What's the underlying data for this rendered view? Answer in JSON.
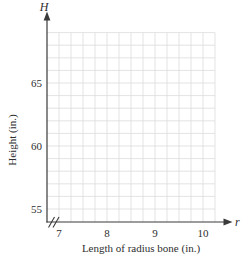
{
  "figure": {
    "background": "#ffffff",
    "axis_color": "#3a3a3a",
    "grid_color": "#dcdcdc",
    "text_color": "#2e2e2e"
  },
  "chart_data": {
    "type": "line",
    "title": "",
    "xlabel": "Length of radius bone (in.)",
    "ylabel": "Height (in.)",
    "x_axis_symbol": "r",
    "y_axis_symbol": "H",
    "x_ticks": [
      "7",
      "8",
      "9",
      "10"
    ],
    "x_tick_values": [
      7,
      8,
      9,
      10
    ],
    "y_ticks": [
      "55",
      "60",
      "65"
    ],
    "y_tick_values": [
      55,
      60,
      65
    ],
    "xlim": [
      7,
      10.25
    ],
    "ylim": [
      54,
      69
    ],
    "x_grid_range": [
      7,
      10.25
    ],
    "y_grid_range": [
      55,
      69
    ],
    "x_minor_step": 0.25,
    "y_minor_step": 1,
    "grid": true,
    "x_axis_break": true,
    "legend": null,
    "series": []
  }
}
